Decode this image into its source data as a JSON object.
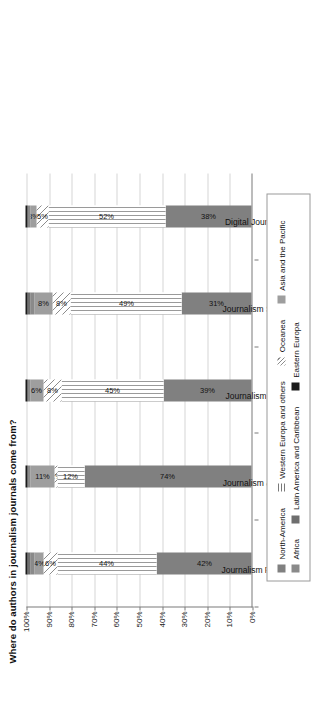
{
  "chart_data": {
    "type": "bar",
    "title": "Where do authors in journalism journals come from?",
    "xlabel": "",
    "ylabel": "",
    "ylim": [
      0,
      100
    ],
    "grid": true,
    "stacked": true,
    "orientation": "vertical-rotated",
    "legend_position": "bottom",
    "categories": [
      "Journalism Practice",
      "Journalism & MCQ",
      "Journalism TP&C",
      "Journalism Studies",
      "Digital Journalism"
    ],
    "ticks": [
      "0%",
      "10%",
      "20%",
      "30%",
      "40%",
      "50%",
      "60%",
      "70%",
      "80%",
      "90%",
      "100%"
    ],
    "tick_values": [
      0,
      10,
      20,
      30,
      40,
      50,
      60,
      70,
      80,
      90,
      100
    ],
    "series": [
      {
        "name": "North-America",
        "key": "north",
        "color": "#808080",
        "pattern": "solid",
        "values": [
          42,
          74,
          39,
          31,
          38
        ],
        "labels": [
          "42%",
          "74%",
          "39%",
          "31%",
          "38%"
        ]
      },
      {
        "name": "Western Europa and others",
        "key": "west",
        "color": "#9a9a9a",
        "pattern": "vertical-lines",
        "values": [
          44,
          12,
          45,
          49,
          52
        ],
        "labels": [
          "44%",
          "12%",
          "45%",
          "49%",
          "52%"
        ]
      },
      {
        "name": "Oceanea",
        "key": "ocean",
        "color": "#8c8c8c",
        "pattern": "diagonal-hatch",
        "values": [
          6,
          1,
          8,
          8,
          5
        ],
        "labels": [
          "6%",
          "1%",
          "8%",
          "8%",
          "5%"
        ]
      },
      {
        "name": "Asia and the Pacific",
        "key": "asia",
        "color": "#9e9e9e",
        "pattern": "solid",
        "values": [
          4,
          11,
          6,
          8,
          3
        ],
        "labels": [
          "4%",
          "11%",
          "6%",
          "8%",
          "3%"
        ]
      },
      {
        "name": "Africa",
        "key": "africa",
        "color": "#8a8a8a",
        "pattern": "solid",
        "values": [
          2,
          1,
          1,
          2,
          1
        ],
        "labels": [
          "",
          "",
          "",
          "",
          ""
        ]
      },
      {
        "name": "Latin America and Caribbean",
        "key": "latin",
        "color": "#6e6e6e",
        "pattern": "solid",
        "values": [
          1,
          0,
          0,
          1,
          0
        ],
        "labels": [
          "",
          "",
          "",
          "",
          ""
        ]
      },
      {
        "name": "Eastern Europa",
        "key": "east",
        "color": "#1b1b1b",
        "pattern": "solid",
        "values": [
          1,
          1,
          1,
          1,
          1
        ],
        "labels": [
          "",
          "",
          "",
          "",
          ""
        ]
      }
    ]
  },
  "legend": {
    "row1": [
      {
        "label": "North-America",
        "key": "north"
      },
      {
        "label": "Western Europa and others",
        "key": "west"
      },
      {
        "label": "Oceanea",
        "key": "ocean"
      },
      {
        "label": "Asia and the Pacific",
        "key": "asia"
      }
    ],
    "row2": [
      {
        "label": "Africa",
        "key": "africa"
      },
      {
        "label": "Latin America and Caribbean",
        "key": "latin"
      },
      {
        "label": "Eastern Europa",
        "key": "east"
      }
    ]
  }
}
